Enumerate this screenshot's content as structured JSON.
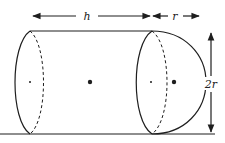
{
  "diagram": {
    "labels": {
      "length": "h",
      "radius": "r",
      "diameter": "2r"
    },
    "colors": {
      "stroke": "#1e1e1e",
      "background": "#ffffff"
    },
    "parts": [
      {
        "name": "cylinder",
        "dimension": "h"
      },
      {
        "name": "hemisphere",
        "dimension": "r"
      }
    ]
  }
}
